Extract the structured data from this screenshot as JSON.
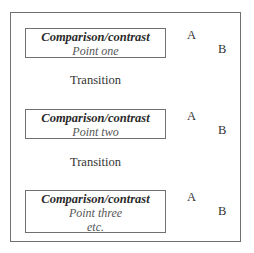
{
  "diagram": {
    "blocks": [
      {
        "heading": "Comparison/contrast",
        "point": "Point one",
        "extra": null,
        "label_a": "A",
        "label_b": "B"
      },
      {
        "heading": "Comparison/contrast",
        "point": "Point two",
        "extra": null,
        "label_a": "A",
        "label_b": "B"
      },
      {
        "heading": "Comparison/contrast",
        "point": "Point three",
        "extra": "etc.",
        "label_a": "A",
        "label_b": "B"
      }
    ],
    "transitions": [
      "Transition",
      "Transition"
    ]
  }
}
